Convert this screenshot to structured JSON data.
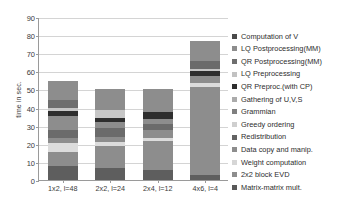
{
  "chart_data": {
    "type": "bar",
    "subtype": "stacked-bar",
    "title": "",
    "xlabel": "",
    "ylabel": "time in sec.",
    "ylim": [
      0,
      90
    ],
    "ytick_labels": [
      "0",
      "10",
      "20",
      "30",
      "40",
      "50",
      "60",
      "70",
      "80",
      "90"
    ],
    "ytick_values": [
      0,
      10,
      20,
      30,
      40,
      50,
      60,
      70,
      80,
      90
    ],
    "grid": true,
    "grid_axis": "y",
    "legend_position": "right",
    "categories": [
      "1x2, l=48",
      "2x2, l=24",
      "2x4, l=12",
      "4x6, l=4"
    ],
    "totals": [
      54.8,
      50.3,
      50.0,
      77.0
    ],
    "series": [
      {
        "name": "Matrix-matrix mult.",
        "color": "#5e5e5e",
        "values": [
          7.5,
          6.8,
          5.5,
          2.5
        ]
      },
      {
        "name": "2x2 block EVD",
        "color": "#8a8a8a",
        "values": [
          8.0,
          12.2,
          16.0,
          49.0
        ]
      },
      {
        "name": "Weight computation",
        "color": "#d8d8d8",
        "values": [
          5.0,
          2.0,
          1.5,
          2.0
        ]
      },
      {
        "name": "Data copy and manip.",
        "color": "#8a8a8a",
        "values": [
          2.5,
          2.5,
          4.5,
          4.0
        ]
      },
      {
        "name": "Redistribution",
        "color": "#6f6f6f",
        "values": [
          4.5,
          5.0,
          3.5,
          2.5
        ]
      },
      {
        "name": "Greedy ordering",
        "color": "#b8b8b8",
        "values": [
          8.0,
          3.7,
          2.5,
          1.5
        ]
      },
      {
        "name": "Grammian",
        "color": "#7a7a7a",
        "values": [
          0.0,
          0.0,
          0.0,
          0.0
        ]
      },
      {
        "name": "Gathering of U,V,S",
        "color": "#a8a8a8",
        "values": [
          0.0,
          0.0,
          0.0,
          0.0
        ]
      },
      {
        "name": "QR Preproc.(with CP)",
        "color": "#2e2e2e",
        "values": [
          2.5,
          1.8,
          4.0,
          4.0
        ]
      },
      {
        "name": "LQ Preprocessing",
        "color": "#c8c8c8",
        "values": [
          1.5,
          4.5,
          1.5,
          1.5
        ]
      },
      {
        "name": "QR Postprocessing(MM)",
        "color": "#6a6a6a",
        "values": [
          4.5,
          0.0,
          0.0,
          0.0
        ]
      },
      {
        "name": "LQ Postprocessing(MM)",
        "color": "#8a8a8a",
        "values": [
          10.8,
          11.8,
          11.0,
          10.0
        ]
      },
      {
        "name": "Computation of V",
        "color": "#5e5e5e",
        "values": [
          0.0,
          0.0,
          0.0,
          0.0
        ]
      }
    ]
  },
  "legend": {
    "items": [
      {
        "label": "Computation of V",
        "color": "#4a4a4a"
      },
      {
        "label": "LQ Postprocessing(MM)",
        "color": "#8d8d8d"
      },
      {
        "label": "QR Postprocessing(MM)",
        "color": "#6e6e6e"
      },
      {
        "label": "LQ Preprocessing",
        "color": "#c2c2c2"
      },
      {
        "label": "QR Preproc.(with CP)",
        "color": "#2e2e2e"
      },
      {
        "label": "Gathering of U,V,S",
        "color": "#ababab"
      },
      {
        "label": "Grammian",
        "color": "#7f7f7f"
      },
      {
        "label": "Greedy ordering",
        "color": "#cfcfcf"
      },
      {
        "label": "Redistribution",
        "color": "#636363"
      },
      {
        "label": "Data copy and manip.",
        "color": "#8d8d8d"
      },
      {
        "label": "Weight computation",
        "color": "#d6d6d6"
      },
      {
        "label": "2x2 block EVD",
        "color": "#8d8d8d"
      },
      {
        "label": "Matrix-matrix mult.",
        "color": "#595959"
      }
    ]
  },
  "bars": [
    {
      "category": "1x2, l=48",
      "total": 54.8,
      "segments": [
        {
          "name": "Matrix-matrix mult.",
          "start": 0.0,
          "end": 7.5,
          "color": "#5e5e5e"
        },
        {
          "name": "2x2 block EVD",
          "start": 7.5,
          "end": 15.5,
          "color": "#8d8d8d"
        },
        {
          "name": "Weight computation",
          "start": 15.5,
          "end": 20.5,
          "color": "#dcdcdc"
        },
        {
          "name": "Data copy and manip.",
          "start": 20.5,
          "end": 23.0,
          "color": "#8d8d8d"
        },
        {
          "name": "Redistribution",
          "start": 23.0,
          "end": 27.5,
          "color": "#6b6b6b"
        },
        {
          "name": "Greedy ordering",
          "start": 27.5,
          "end": 35.5,
          "color": "#8d8d8d"
        },
        {
          "name": "QR Preproc.(with CP)",
          "start": 35.5,
          "end": 38.0,
          "color": "#2e2e2e"
        },
        {
          "name": "LQ Preprocessing",
          "start": 38.0,
          "end": 39.5,
          "color": "#c6c6c6"
        },
        {
          "name": "QR Postprocessing(MM)",
          "start": 39.5,
          "end": 44.0,
          "color": "#6e6e6e"
        },
        {
          "name": "LQ Postprocessing(MM)",
          "start": 44.0,
          "end": 54.8,
          "color": "#8d8d8d"
        }
      ]
    },
    {
      "category": "2x2, l=24",
      "total": 50.3,
      "segments": [
        {
          "name": "Matrix-matrix mult.",
          "start": 0.0,
          "end": 6.8,
          "color": "#5e5e5e"
        },
        {
          "name": "2x2 block EVD",
          "start": 6.8,
          "end": 19.0,
          "color": "#8d8d8d"
        },
        {
          "name": "Weight computation",
          "start": 19.0,
          "end": 21.0,
          "color": "#dcdcdc"
        },
        {
          "name": "Data copy and manip.",
          "start": 21.0,
          "end": 23.5,
          "color": "#8d8d8d"
        },
        {
          "name": "Redistribution",
          "start": 23.5,
          "end": 28.5,
          "color": "#6b6b6b"
        },
        {
          "name": "Greedy ordering",
          "start": 28.5,
          "end": 32.2,
          "color": "#8d8d8d"
        },
        {
          "name": "QR Preproc.(with CP)",
          "start": 32.2,
          "end": 34.0,
          "color": "#2e2e2e"
        },
        {
          "name": "LQ Preprocessing",
          "start": 34.0,
          "end": 38.5,
          "color": "#c6c6c6"
        },
        {
          "name": "LQ Postprocessing(MM)",
          "start": 38.5,
          "end": 50.3,
          "color": "#8d8d8d"
        }
      ]
    },
    {
      "category": "2x4, l=12",
      "total": 50.0,
      "segments": [
        {
          "name": "Matrix-matrix mult.",
          "start": 0.0,
          "end": 5.5,
          "color": "#5e5e5e"
        },
        {
          "name": "2x2 block EVD",
          "start": 5.5,
          "end": 21.5,
          "color": "#8d8d8d"
        },
        {
          "name": "Weight computation",
          "start": 21.5,
          "end": 23.0,
          "color": "#dcdcdc"
        },
        {
          "name": "Data copy and manip.",
          "start": 23.0,
          "end": 27.5,
          "color": "#8d8d8d"
        },
        {
          "name": "Redistribution",
          "start": 27.5,
          "end": 31.0,
          "color": "#6b6b6b"
        },
        {
          "name": "Greedy ordering",
          "start": 31.0,
          "end": 33.5,
          "color": "#8d8d8d"
        },
        {
          "name": "QR Preproc.(with CP)",
          "start": 33.5,
          "end": 37.5,
          "color": "#2e2e2e"
        },
        {
          "name": "LQ Postprocessing(MM)",
          "start": 37.5,
          "end": 50.0,
          "color": "#8d8d8d"
        }
      ]
    },
    {
      "category": "4x6, l=4",
      "total": 77.0,
      "segments": [
        {
          "name": "Matrix-matrix mult.",
          "start": 0.0,
          "end": 2.5,
          "color": "#5e5e5e"
        },
        {
          "name": "2x2 block EVD",
          "start": 2.5,
          "end": 51.5,
          "color": "#8d8d8d"
        },
        {
          "name": "Weight computation",
          "start": 51.5,
          "end": 53.5,
          "color": "#dcdcdc"
        },
        {
          "name": "Data copy and manip.",
          "start": 53.5,
          "end": 57.5,
          "color": "#8d8d8d"
        },
        {
          "name": "QR Preproc.(with CP)",
          "start": 57.5,
          "end": 60.0,
          "color": "#2e2e2e"
        },
        {
          "name": "LQ Preprocessing",
          "start": 60.0,
          "end": 61.5,
          "color": "#c6c6c6"
        },
        {
          "name": "Greedy ordering",
          "start": 61.5,
          "end": 65.5,
          "color": "#6b6b6b"
        },
        {
          "name": "LQ Postprocessing(MM)",
          "start": 65.5,
          "end": 77.0,
          "color": "#8d8d8d"
        }
      ]
    }
  ]
}
